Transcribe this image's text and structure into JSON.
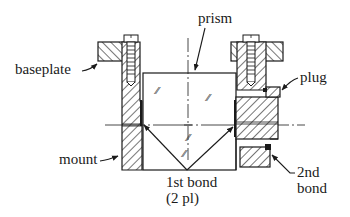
{
  "figure": {
    "type": "mechanical cross-section diagram"
  },
  "labels": {
    "baseplate": "baseplate",
    "prism": "prism",
    "plug": "plug",
    "mount": "mount",
    "first_bond_line1": "1st bond",
    "first_bond_line2": "(2 pl)",
    "second_bond_line1": "2nd",
    "second_bond_line2": "bond"
  },
  "glass_marks": [
    "⁄⁄",
    "⁄⁄",
    "⁄⁄",
    "⁄⁄"
  ],
  "colors": {
    "ink": "#1a1a1a",
    "background": "#ffffff"
  }
}
